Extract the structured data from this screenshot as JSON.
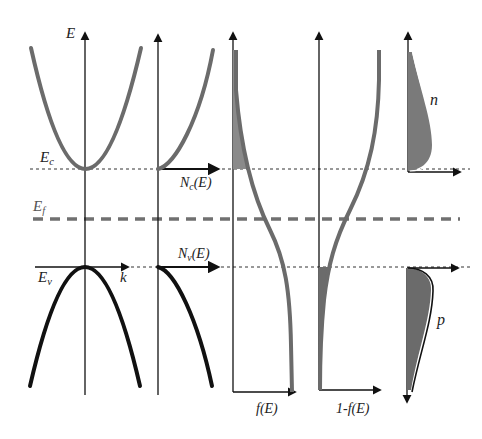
{
  "colors": {
    "axis": "#111111",
    "conduction_band": "#6b6b6b",
    "valence_band": "#111111",
    "fermi_line": "#707070",
    "fill": "#8a8a8a",
    "background": "#ffffff"
  },
  "labels": {
    "energy_axis": "E",
    "ec": "E",
    "ec_sub": "c",
    "ef": "E",
    "ef_sub": "f",
    "ev": "E",
    "ev_sub": "v",
    "k_axis": "k",
    "nc": "N",
    "nc_sub": "c",
    "nc_tail": "(E)",
    "nv": "N",
    "nv_sub": "v",
    "nv_tail": "(E)",
    "fe": "f(E)",
    "one_minus_fe": "1-f(E)",
    "electrons": "n",
    "holes": "p"
  },
  "panels": [
    {
      "name": "E-k band diagram",
      "axis_x": 85
    },
    {
      "name": "Density of states",
      "axis_x": 158
    },
    {
      "name": "Fermi-Dirac f(E)",
      "axis_x": 233
    },
    {
      "name": "1-f(E)",
      "axis_x": 319
    },
    {
      "name": "Carrier concentration",
      "axis_x": 408
    }
  ],
  "levels": {
    "Ec_y": 169,
    "Ef_y": 219,
    "Ev_y": 267
  }
}
